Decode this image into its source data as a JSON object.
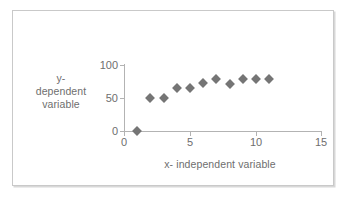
{
  "chart_data": {
    "type": "scatter",
    "title": "",
    "xlabel": "x- independent variable",
    "ylabel_lines": [
      "y-",
      "dependent",
      "variable"
    ],
    "ylabel": "y- dependent variable",
    "x": [
      1,
      2,
      3,
      4,
      5,
      6,
      7,
      8,
      9,
      10,
      11
    ],
    "values": [
      0,
      50,
      50,
      65,
      65,
      72,
      79,
      71,
      79,
      79,
      79
    ],
    "points": [
      {
        "x": 1,
        "y": 0
      },
      {
        "x": 2,
        "y": 50
      },
      {
        "x": 3,
        "y": 50
      },
      {
        "x": 4,
        "y": 65
      },
      {
        "x": 5,
        "y": 65
      },
      {
        "x": 6,
        "y": 72
      },
      {
        "x": 7,
        "y": 79
      },
      {
        "x": 8,
        "y": 71
      },
      {
        "x": 9,
        "y": 79
      },
      {
        "x": 10,
        "y": 79
      },
      {
        "x": 11,
        "y": 79
      }
    ],
    "xlim": [
      0,
      15
    ],
    "ylim": [
      0,
      100
    ],
    "xticks": [
      0,
      5,
      10,
      15
    ],
    "yticks": [
      0,
      50,
      100
    ],
    "xtick_labels": [
      "0",
      "5",
      "10",
      "15"
    ],
    "ytick_labels": [
      "0",
      "50",
      "100"
    ],
    "grid": false,
    "legend": false,
    "marker": "diamond",
    "marker_color": "#757575",
    "axis_color": "#b3b3b3",
    "text_color": "#6e6e6e",
    "background": "#ffffff",
    "frame_border_color": "#c9c9c9"
  }
}
